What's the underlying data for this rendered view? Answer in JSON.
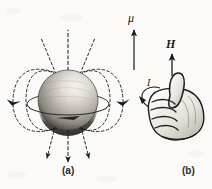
{
  "figure": {
    "background_color": "#fbfaf8",
    "ink_color": "#1b1b1b"
  },
  "panels": [
    {
      "id": "a",
      "label": "(a)",
      "caption": "Uniformly magnetized sphere with dipole magnetic field lines and equatorial surface current ring",
      "elements": {
        "sphere": {
          "name": "magnetized-sphere",
          "cx": 68,
          "cy": 100,
          "r": 30,
          "highlight_color": "#f2efe9",
          "midtone_color": "#9d9892",
          "shadow_color": "#1d1b19"
        },
        "equatorial_ring": {
          "name": "equatorial-current-ring",
          "cx": 68,
          "cy": 104,
          "rx": 41,
          "ry": 11
        },
        "field_lines_top": 3,
        "field_lines_bottom": 3,
        "outer_loops": 2,
        "inner_loops": 2,
        "arrowheads": 6,
        "line_style": "dashed"
      }
    },
    {
      "id": "b",
      "label": "(b)",
      "caption": "Right hand with thumb along H and fingers curling in the direction of current I",
      "elements": {
        "hand": {
          "name": "right-hand-thumbs-up"
        },
        "vectors": [
          {
            "name": "mu-vector",
            "label": "μ",
            "direction": "up",
            "x": 134,
            "y1": 68,
            "y2": 26
          },
          {
            "name": "H-vector",
            "label": "H",
            "direction": "up",
            "x": 172,
            "y1": 74,
            "y2": 52
          }
        ],
        "current_arrow": {
          "name": "current-arrow",
          "label": "I",
          "direction": "counterclockwise"
        }
      }
    }
  ],
  "labels": {
    "mu": "μ",
    "H": "H",
    "I": "I",
    "panel_a": "(a)",
    "panel_b": "(b)"
  }
}
